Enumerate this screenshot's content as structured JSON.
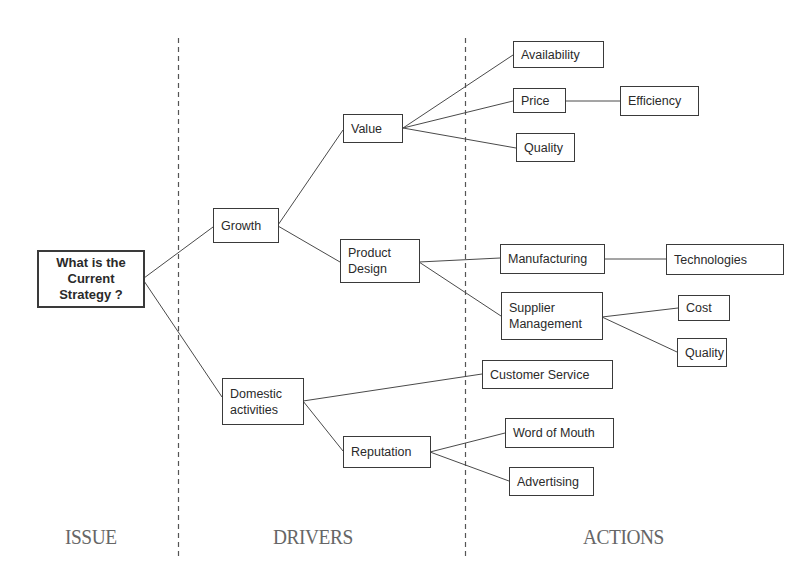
{
  "columns": {
    "issue": "ISSUE",
    "drivers": "DRIVERS",
    "actions": "ACTIONS"
  },
  "nodes": {
    "root": "What is the\nCurrent\nStrategy ?",
    "growth": "Growth",
    "domestic": "Domestic\nactivities",
    "value": "Value",
    "product_design": "Product\nDesign",
    "reputation": "Reputation",
    "availability": "Availability",
    "price": "Price",
    "efficiency": "Efficiency",
    "quality_value": "Quality",
    "manufacturing": "Manufacturing",
    "technologies": "Technologies",
    "supplier_management": "Supplier\nManagement",
    "cost": "Cost",
    "quality_supplier": "Quality",
    "customer_service": "Customer Service",
    "word_of_mouth": "Word of Mouth",
    "advertising": "Advertising"
  },
  "edges": [
    [
      "root",
      "growth"
    ],
    [
      "root",
      "domestic"
    ],
    [
      "growth",
      "value"
    ],
    [
      "growth",
      "product_design"
    ],
    [
      "value",
      "availability"
    ],
    [
      "value",
      "price"
    ],
    [
      "value",
      "quality_value"
    ],
    [
      "price",
      "efficiency"
    ],
    [
      "product_design",
      "manufacturing"
    ],
    [
      "product_design",
      "supplier_management"
    ],
    [
      "manufacturing",
      "technologies"
    ],
    [
      "supplier_management",
      "cost"
    ],
    [
      "supplier_management",
      "quality_supplier"
    ],
    [
      "domestic",
      "customer_service"
    ],
    [
      "domestic",
      "reputation"
    ],
    [
      "reputation",
      "word_of_mouth"
    ],
    [
      "reputation",
      "advertising"
    ]
  ],
  "colors": {
    "line": "#4a4a4a",
    "divider": "#555555",
    "label": "#666666"
  }
}
